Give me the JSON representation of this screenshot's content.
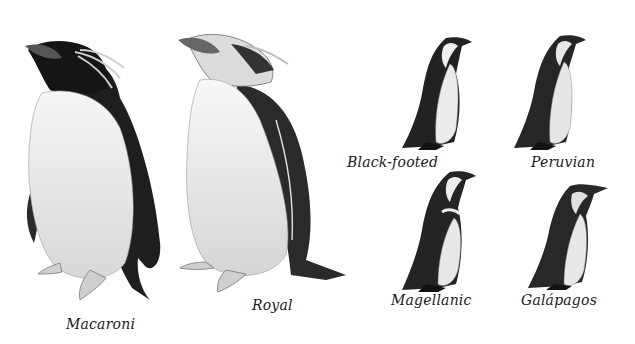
{
  "figure": {
    "background": "#ffffff",
    "ink_dark": "#1c1c1c",
    "ink_mid": "#5a5a5a",
    "belly": "#ececec",
    "penguins": [
      {
        "id": "macaroni",
        "label": "Macaroni"
      },
      {
        "id": "royal",
        "label": "Royal"
      },
      {
        "id": "black-footed",
        "label": "Black-footed"
      },
      {
        "id": "peruvian",
        "label": "Peruvian"
      },
      {
        "id": "magellanic",
        "label": "Magellanic"
      },
      {
        "id": "galapagos",
        "label": "Galápagos"
      }
    ]
  }
}
